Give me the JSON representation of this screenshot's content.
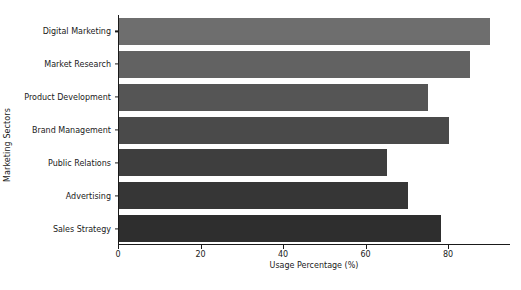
{
  "chart_data": {
    "type": "bar",
    "orientation": "horizontal",
    "title": "",
    "xlabel": "Usage Percentage (%)",
    "ylabel": "Marketing Sectors",
    "categories": [
      "Digital Marketing",
      "Market Research",
      "Product Development",
      "Brand Management",
      "Public Relations",
      "Advertising",
      "Sales Strategy"
    ],
    "values": [
      90,
      85,
      75,
      80,
      65,
      70,
      78
    ],
    "bar_colors": [
      "#6e6e6e",
      "#626262",
      "#555555",
      "#4a4a4a",
      "#3e3e3e",
      "#363636",
      "#2e2e2e"
    ],
    "xlim": [
      0,
      95
    ],
    "xticks": [
      0,
      20,
      40,
      60,
      80
    ],
    "xticklabels": [
      "0",
      "20",
      "40",
      "60",
      "80"
    ],
    "grid": false,
    "legend": false,
    "spines": {
      "left": true,
      "bottom": true,
      "top": false,
      "right": false
    },
    "background_color": "#ffffff",
    "text_color": "#1a1a1a"
  }
}
